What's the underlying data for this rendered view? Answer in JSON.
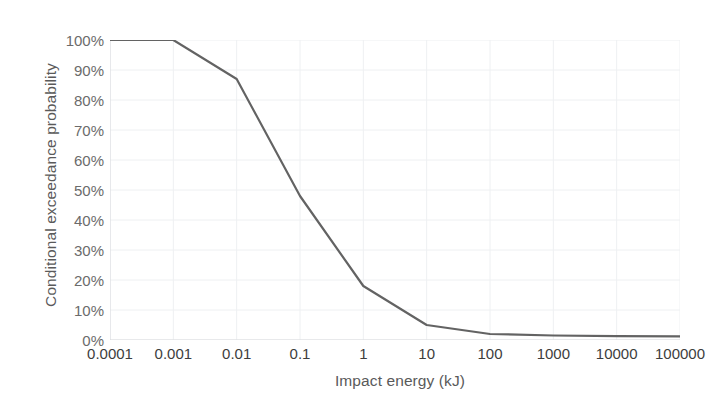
{
  "chart_data": {
    "type": "line",
    "title": "",
    "xlabel": "Impact energy (kJ)",
    "ylabel": "Conditional exceedance probability",
    "xscale": "log",
    "xlim": [
      0.0001,
      100000
    ],
    "ylim": [
      0,
      1
    ],
    "grid": true,
    "legend": "none",
    "xtick_labels": [
      "0.0001",
      "0.001",
      "0.01",
      "0.1",
      "1",
      "10",
      "100",
      "1000",
      "10000",
      "100000"
    ],
    "xtick_values": [
      0.0001,
      0.001,
      0.01,
      0.1,
      1,
      10,
      100,
      1000,
      10000,
      100000
    ],
    "ytick_labels": [
      "0%",
      "10%",
      "20%",
      "30%",
      "40%",
      "50%",
      "60%",
      "70%",
      "80%",
      "90%",
      "100%"
    ],
    "ytick_values": [
      0,
      10,
      20,
      30,
      40,
      50,
      60,
      70,
      80,
      90,
      100
    ],
    "series": [
      {
        "name": "Conditional exceedance probability",
        "color": "#636363",
        "linewidth": 2.2,
        "x": [
          0.0001,
          0.001,
          0.01,
          0.1,
          1,
          10,
          100,
          1000,
          10000,
          100000
        ],
        "y": [
          100,
          100,
          87,
          48,
          18,
          5,
          2,
          1.5,
          1.3,
          1.2
        ]
      }
    ]
  },
  "axes": {
    "y_title": "Conditional exceedance probability",
    "x_title": "Impact energy (kJ)"
  },
  "colors": {
    "line": "#636363",
    "grid": "#eef0f2",
    "axis_text": "#6b6b6b",
    "x_axis_text": "#3d3d3d",
    "title_text": "#5a5a5a",
    "background": "#ffffff"
  }
}
